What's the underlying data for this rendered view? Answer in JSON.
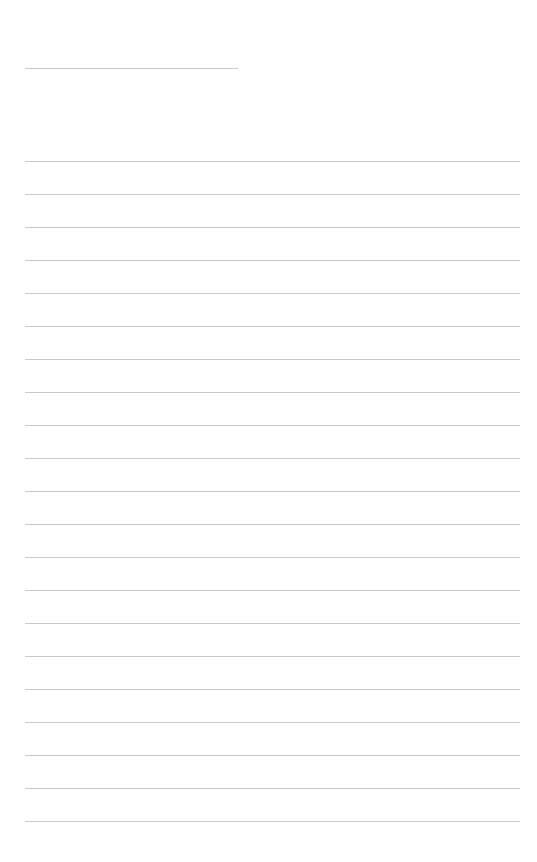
{
  "page": {
    "type": "lined-paper",
    "background_color": "#ffffff",
    "line_color": "#c9c9c9",
    "title_line": {
      "x": 25,
      "y": 68,
      "width": 213,
      "text": ""
    },
    "ruled_lines": {
      "count": 21,
      "start_y": 161,
      "spacing": 33,
      "x": 25,
      "width": 495,
      "texts": [
        "",
        "",
        "",
        "",
        "",
        "",
        "",
        "",
        "",
        "",
        "",
        "",
        "",
        "",
        "",
        "",
        "",
        "",
        "",
        "",
        ""
      ]
    }
  }
}
